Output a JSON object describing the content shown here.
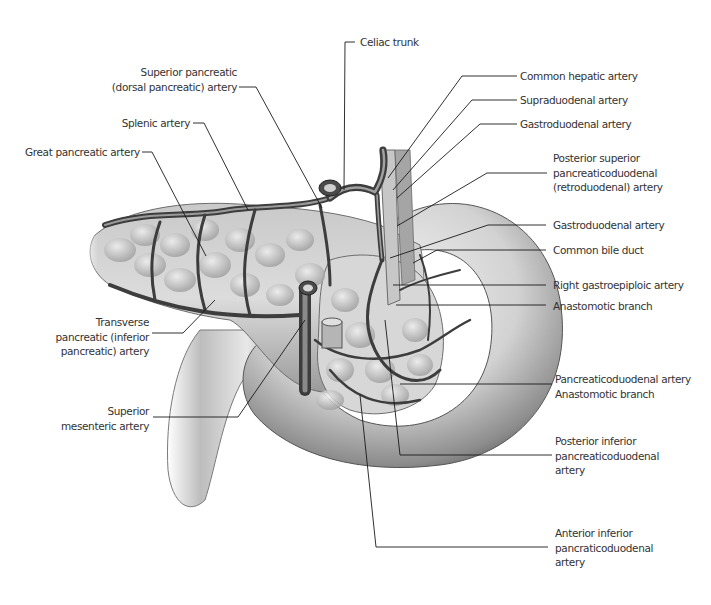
{
  "figure": {
    "style": "grayscale anatomical illustration with leader-line labels"
  },
  "labels": {
    "celiac_trunk": {
      "lines": [
        "Celiac trunk"
      ]
    },
    "superior_pancreatic": {
      "lines": [
        "Superior pancreatic",
        "(dorsal pancreatic) artery"
      ]
    },
    "splenic_artery": {
      "lines": [
        "Splenic artery"
      ]
    },
    "great_pancreatic": {
      "lines": [
        "Great pancreatic artery"
      ]
    },
    "transverse_pancreatic": {
      "lines": [
        "Transverse",
        "pancreatic (inferior",
        "pancreatic) artery"
      ]
    },
    "superior_mesenteric": {
      "lines": [
        "Superior",
        "mesenteric artery"
      ]
    },
    "common_hepatic": {
      "lines": [
        "Common hepatic artery"
      ]
    },
    "supraduodenal": {
      "lines": [
        "Supraduodenal artery"
      ]
    },
    "gastroduodenal_top": {
      "lines": [
        "Gastroduodenal artery"
      ]
    },
    "posterior_superior_pd": {
      "lines": [
        "Posterior superior",
        "pancreaticoduodenal",
        "(retroduodenal) artery"
      ]
    },
    "gastroduodenal_mid": {
      "lines": [
        "Gastroduodenal artery"
      ]
    },
    "common_bile_duct": {
      "lines": [
        "Common bile duct"
      ]
    },
    "right_gastroepiploic": {
      "lines": [
        "Right gastroepiploic artery"
      ]
    },
    "anastomotic_branch": {
      "lines": [
        "Anastomotic branch"
      ]
    },
    "pancreaticoduodenal_anastomotic": {
      "lines": [
        "Pancreaticoduodenal artery",
        "Anastomotic branch"
      ]
    },
    "posterior_inferior_pd": {
      "lines": [
        "Posterior inferior",
        "pancreaticoduodenal",
        "artery"
      ]
    },
    "anterior_inferior_pd": {
      "lines": [
        "Anterior inferior",
        "pancraticoduodenal",
        "artery"
      ]
    }
  },
  "colors": {
    "background": "#ffffff",
    "label_text": "#333333",
    "leader_line": "#1a1a1a",
    "tissue_light": "#e6e6e6",
    "tissue_mid": "#b5b5b5",
    "tissue_dark": "#5a5a5a",
    "vessel": "#4a4a4a"
  }
}
